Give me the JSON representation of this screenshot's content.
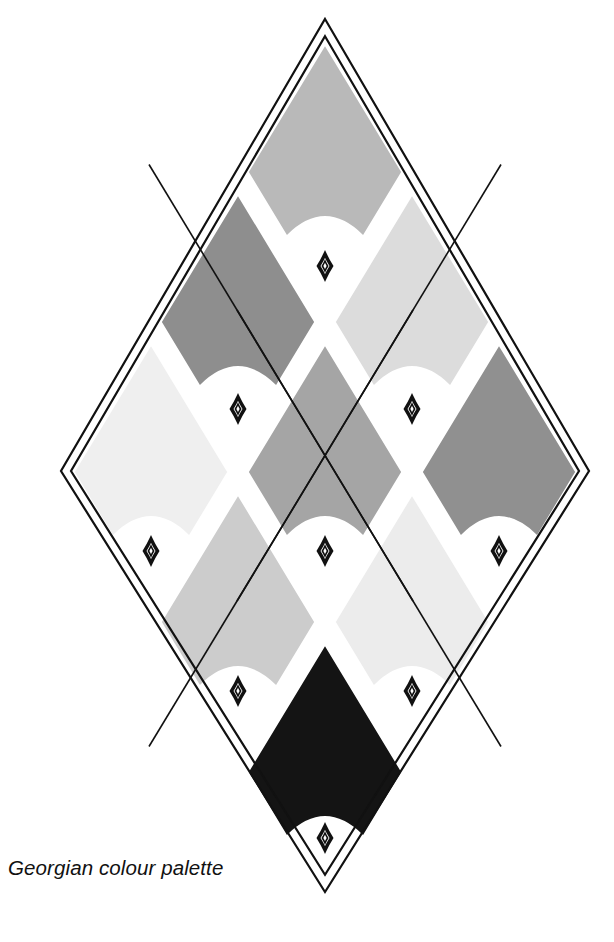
{
  "figure": {
    "title": "Georgian colour palette",
    "caption": "Georgian colour palette",
    "type": "decorative-diamond-swatch-chart",
    "canvas": {
      "width": 614,
      "height": 942,
      "background": "#ffffff"
    },
    "frame": {
      "shape": "diamond",
      "style": "double-outline",
      "stroke_color": "#111111",
      "outer": {
        "top_x": 325,
        "top_y": 19,
        "bottom_y": 892,
        "left_x": 61,
        "right_x": 589,
        "mid_y": 471
      },
      "inner_inset": 10,
      "stroke_width": 2.2
    },
    "grid": {
      "columns": 3,
      "rows": 3,
      "diagonal_rows": [
        1,
        2,
        3,
        2,
        1
      ],
      "line_color": "#111111",
      "line_width": 1.6,
      "cell_gap_fill": "#ffffff"
    },
    "ornament": {
      "name": "lozenge-ornament",
      "shape": "concave-sided-diamond-outline",
      "stroke_color": "#111111",
      "fill": "#ffffff",
      "width": 13,
      "height": 24,
      "count": 10
    }
  },
  "chart_data": {
    "type": "table",
    "title": "Georgian colour palette",
    "xlabel": "",
    "ylabel": "",
    "legend_position": "none",
    "grid": true,
    "columns": [
      "swatch",
      "grid_row",
      "grid_col",
      "hex",
      "tone"
    ],
    "swatches": [
      {
        "id": "swatch-1",
        "label": "Swatch 1",
        "hex": "#b9b9b9",
        "tone": "mid grey",
        "grid_row": 1,
        "grid_col": 2,
        "cx": 325,
        "cy": 172
      },
      {
        "id": "swatch-2",
        "label": "Swatch 2",
        "hex": "#8e8e8e",
        "tone": "dark mid grey",
        "grid_row": 1,
        "grid_col": 1,
        "cx": 238,
        "cy": 322
      },
      {
        "id": "swatch-3",
        "label": "Swatch 3",
        "hex": "#dcdcdc",
        "tone": "pale grey",
        "grid_row": 2,
        "grid_col": 3,
        "cx": 412,
        "cy": 322
      },
      {
        "id": "swatch-4",
        "label": "Swatch 4",
        "hex": "#efefef",
        "tone": "near white",
        "grid_row": 1,
        "grid_col": 0,
        "cx": 151,
        "cy": 472
      },
      {
        "id": "swatch-5",
        "label": "Swatch 5",
        "hex": "#a5a5a5",
        "tone": "medium grey",
        "grid_row": 2,
        "grid_col": 2,
        "cx": 325,
        "cy": 472
      },
      {
        "id": "swatch-6",
        "label": "Swatch 6",
        "hex": "#909090",
        "tone": "dark grey",
        "grid_row": 3,
        "grid_col": 3,
        "cx": 499,
        "cy": 472
      },
      {
        "id": "swatch-7",
        "label": "Swatch 7",
        "hex": "#cccccc",
        "tone": "light grey",
        "grid_row": 2,
        "grid_col": 1,
        "cx": 238,
        "cy": 622
      },
      {
        "id": "swatch-8",
        "label": "Swatch 8",
        "hex": "#ececec",
        "tone": "off white",
        "grid_row": 3,
        "grid_col": 2,
        "cx": 412,
        "cy": 622
      },
      {
        "id": "swatch-9",
        "label": "Swatch 9",
        "hex": "#141414",
        "tone": "near black",
        "grid_row": 3,
        "grid_col": 1,
        "cx": 325,
        "cy": 772
      }
    ],
    "ornament_positions": [
      {
        "id": "ornament-1",
        "cx": 325,
        "cy": 266
      },
      {
        "id": "ornament-2",
        "cx": 238,
        "cy": 409
      },
      {
        "id": "ornament-3",
        "cx": 412,
        "cy": 409
      },
      {
        "id": "ornament-4",
        "cx": 151,
        "cy": 551
      },
      {
        "id": "ornament-5",
        "cx": 325,
        "cy": 551
      },
      {
        "id": "ornament-6",
        "cx": 499,
        "cy": 551
      },
      {
        "id": "ornament-7",
        "cx": 238,
        "cy": 691
      },
      {
        "id": "ornament-8",
        "cx": 412,
        "cy": 691
      },
      {
        "id": "ornament-9",
        "cx": 325,
        "cy": 838
      }
    ]
  }
}
